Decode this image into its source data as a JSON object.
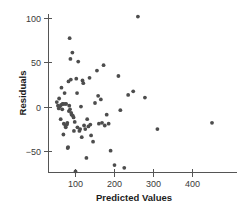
{
  "chart_data": {
    "type": "scatter",
    "title": "",
    "xlabel": "Predicted Values",
    "ylabel": "Residuals",
    "xlim": [
      40,
      465
    ],
    "ylim": [
      -80,
      110
    ],
    "xticks": [
      100,
      200,
      300,
      400
    ],
    "yticks": [
      100,
      50,
      0,
      -50
    ],
    "xtick_labels": [
      "100",
      "200",
      "300",
      "400"
    ],
    "ytick_labels": [
      "100",
      "50",
      "0",
      "−50"
    ],
    "grid": false,
    "legend": null,
    "marker": "filled-circle",
    "marker_color": "#4d4d4d",
    "n_points": 76,
    "points": [
      [
        52,
        6
      ],
      [
        55,
        2
      ],
      [
        57,
        -1
      ],
      [
        58,
        10
      ],
      [
        60,
        1
      ],
      [
        62,
        -13
      ],
      [
        63,
        3
      ],
      [
        64,
        22
      ],
      [
        66,
        -2
      ],
      [
        67,
        4
      ],
      [
        68,
        4
      ],
      [
        69,
        -30
      ],
      [
        70,
        -18
      ],
      [
        72,
        16
      ],
      [
        73,
        4
      ],
      [
        74,
        -20
      ],
      [
        75,
        -22
      ],
      [
        76,
        4
      ],
      [
        78,
        -19
      ],
      [
        79,
        -17
      ],
      [
        80,
        -45
      ],
      [
        81,
        -44
      ],
      [
        82,
        29
      ],
      [
        83,
        -4
      ],
      [
        84,
        2
      ],
      [
        85,
        77
      ],
      [
        86,
        -2
      ],
      [
        87,
        54
      ],
      [
        88,
        31
      ],
      [
        89,
        -6
      ],
      [
        90,
        -8
      ],
      [
        92,
        61
      ],
      [
        93,
        -9
      ],
      [
        95,
        -11
      ],
      [
        96,
        -26
      ],
      [
        98,
        -16
      ],
      [
        100,
        -71
      ],
      [
        102,
        32
      ],
      [
        104,
        16
      ],
      [
        105,
        -22
      ],
      [
        107,
        51
      ],
      [
        110,
        -26
      ],
      [
        112,
        -24
      ],
      [
        114,
        1
      ],
      [
        116,
        -33
      ],
      [
        118,
        30
      ],
      [
        120,
        27
      ],
      [
        122,
        -20
      ],
      [
        125,
        -24
      ],
      [
        128,
        -56
      ],
      [
        130,
        -13
      ],
      [
        133,
        -21
      ],
      [
        136,
        33
      ],
      [
        138,
        -19
      ],
      [
        140,
        -31
      ],
      [
        145,
        -38
      ],
      [
        150,
        5
      ],
      [
        155,
        41
      ],
      [
        158,
        13
      ],
      [
        160,
        -18
      ],
      [
        165,
        9
      ],
      [
        168,
        -17
      ],
      [
        172,
        47
      ],
      [
        175,
        -20
      ],
      [
        180,
        -8
      ],
      [
        185,
        -18
      ],
      [
        190,
        -48
      ],
      [
        200,
        -64
      ],
      [
        210,
        35
      ],
      [
        215,
        -3
      ],
      [
        225,
        -67
      ],
      [
        235,
        14
      ],
      [
        248,
        18
      ],
      [
        260,
        101
      ],
      [
        278,
        11
      ],
      [
        310,
        -24
      ],
      [
        450,
        -17
      ]
    ]
  },
  "axis": {
    "x_axis_name": "x-axis",
    "y_axis_name": "y-axis"
  }
}
